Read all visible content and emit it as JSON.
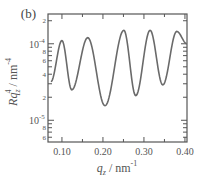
{
  "chart_data": {
    "type": "line",
    "panel_label": "(b)",
    "title": "",
    "xlabel": "q_z / nm^-1",
    "ylabel": "Rq_z^4 / nm^-4",
    "xlabel_parts": {
      "var": "q",
      "sub": "z",
      "unit": " / nm",
      "sup": "-1"
    },
    "ylabel_parts": {
      "var": "Rq",
      "sub": "z",
      "sup1": "4",
      "unit": " / nm",
      "sup2": "-4"
    },
    "xlim": [
      0.066,
      0.405
    ],
    "ylim": [
      5.2e-06,
      0.000245
    ],
    "yscale": "log",
    "grid": false,
    "x_ticks": [
      {
        "value": 0.1,
        "label": "0.10"
      },
      {
        "value": 0.2,
        "label": "0.20"
      },
      {
        "value": 0.3,
        "label": "0.30"
      },
      {
        "value": 0.4,
        "label": "0.40"
      }
    ],
    "x_minor_ticks": [
      0.15,
      0.25,
      0.35
    ],
    "y_major_ticks": [
      {
        "value": 0.0001,
        "base": "10",
        "exp": "-4"
      },
      {
        "value": 1e-05,
        "base": "10",
        "exp": "-5"
      }
    ],
    "y_minor_labels": [
      {
        "value": 0.0002,
        "label": "2"
      },
      {
        "value": 8e-05,
        "label": "8"
      },
      {
        "value": 6e-05,
        "label": "6"
      },
      {
        "value": 4e-05,
        "label": "4"
      },
      {
        "value": 2e-05,
        "label": "2"
      },
      {
        "value": 8e-06,
        "label": "8"
      },
      {
        "value": 6e-06,
        "label": "6"
      }
    ],
    "y_minor_ticks": [
      9e-05,
      7e-05,
      5e-05,
      3e-05,
      9e-06,
      7e-06
    ],
    "series": [
      {
        "name": "reflectivity",
        "color": "#6a6a6a",
        "points": [
          [
            0.073,
            3.2e-05
          ],
          [
            0.1,
            0.00011
          ],
          [
            0.124,
            2.5e-05
          ],
          [
            0.163,
            0.00012
          ],
          [
            0.205,
            1.55e-05
          ],
          [
            0.251,
            0.00015
          ],
          [
            0.28,
            2.1e-05
          ],
          [
            0.315,
            0.00015
          ],
          [
            0.346,
            2.9e-05
          ],
          [
            0.38,
            0.000145
          ],
          [
            0.405,
            0.0001
          ]
        ]
      }
    ]
  }
}
